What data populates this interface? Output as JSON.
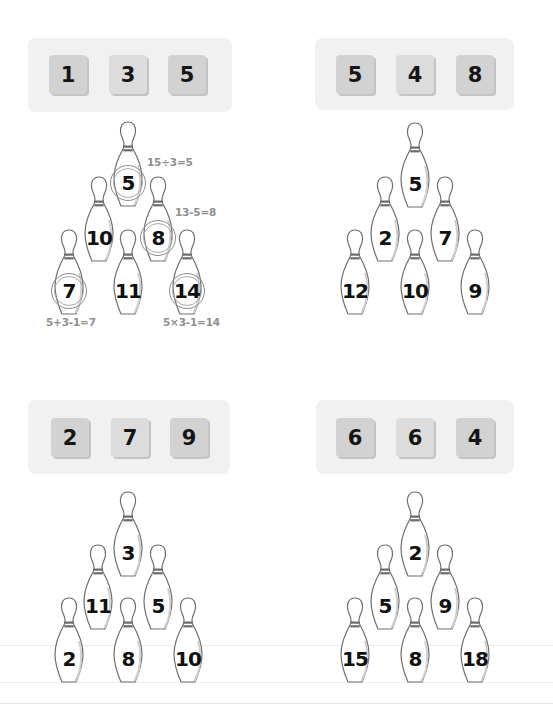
{
  "colors": {
    "background": "#ffffff",
    "tile_panel": "#f1f1f1",
    "tile": "#d2d2d2",
    "number_text": "#111111",
    "annotation_text": "#8f8f8f"
  },
  "puzzles": [
    {
      "id": "top-left",
      "tiles": [
        "1",
        "3",
        "5"
      ],
      "pins": {
        "top": "5",
        "middle_left": "10",
        "middle_right": "8",
        "bottom_left": "7",
        "bottom_middle": "11",
        "bottom_right": "14"
      },
      "circled": [
        "top",
        "middle_right",
        "bottom_left",
        "bottom_right"
      ],
      "annotations": {
        "top": "15÷3=5",
        "middle_right": "13-5=8",
        "bottom_left": "5+3-1=7",
        "bottom_right": "5×3-1=14"
      }
    },
    {
      "id": "top-right",
      "tiles": [
        "5",
        "4",
        "8"
      ],
      "pins": {
        "top": "5",
        "middle_left": "2",
        "middle_right": "7",
        "bottom_left": "12",
        "bottom_middle": "10",
        "bottom_right": "9"
      }
    },
    {
      "id": "bottom-left",
      "tiles": [
        "2",
        "7",
        "9"
      ],
      "pins": {
        "top": "3",
        "middle_left": "11",
        "middle_right": "5",
        "bottom_left": "2",
        "bottom_middle": "8",
        "bottom_right": "10"
      }
    },
    {
      "id": "bottom-right",
      "tiles": [
        "6",
        "6",
        "4"
      ],
      "pins": {
        "top": "2",
        "middle_left": "5",
        "middle_right": "9",
        "bottom_left": "15",
        "bottom_middle": "8",
        "bottom_right": "18"
      }
    }
  ]
}
